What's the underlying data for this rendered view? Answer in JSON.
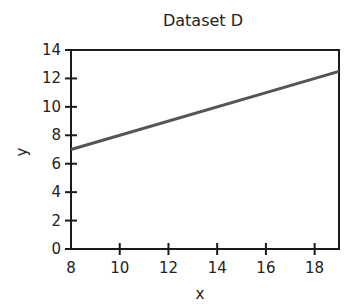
{
  "chart_data": {
    "type": "line",
    "title": "Dataset D",
    "xlabel": "x",
    "ylabel": "y",
    "xlim": [
      8,
      19
    ],
    "ylim": [
      0,
      14
    ],
    "xticks": [
      8,
      10,
      12,
      14,
      16,
      18
    ],
    "yticks": [
      0,
      2,
      4,
      6,
      8,
      10,
      12,
      14
    ],
    "grid": false,
    "series": [
      {
        "name": "fit line",
        "x": [
          8,
          19
        ],
        "y": [
          7,
          12.5
        ],
        "color": "#555555"
      }
    ]
  }
}
